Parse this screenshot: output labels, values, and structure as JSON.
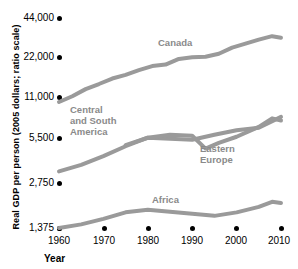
{
  "chart_data": {
    "type": "line",
    "title": "",
    "xlabel": "Year",
    "ylabel": "Real GDP per person (2005 dollars; ratio scale)",
    "scale": "ratio (log) scale",
    "grid": false,
    "legend_position": "inline-labels",
    "xlim": [
      1960,
      2010
    ],
    "ylim": [
      1375,
      44000
    ],
    "xticks": [
      1960,
      1970,
      1980,
      1990,
      2000,
      2010
    ],
    "yticks": [
      1375,
      2750,
      5500,
      11000,
      22000,
      44000
    ],
    "ytick_labels": [
      "1,375",
      "2,750",
      "5,500",
      "11,000",
      "22,000",
      "44,000"
    ],
    "series": [
      {
        "name": "Canada",
        "color": "#9a9a9a",
        "x": [
          1960,
          1963,
          1966,
          1969,
          1972,
          1975,
          1978,
          1981,
          1984,
          1987,
          1990,
          1993,
          1996,
          1999,
          2002,
          2005,
          2008,
          2010
        ],
        "values": [
          11000,
          12100,
          13600,
          14800,
          16200,
          17200,
          18600,
          19900,
          20400,
          22400,
          23000,
          23200,
          24400,
          27000,
          28800,
          30800,
          32600,
          31800
        ]
      },
      {
        "name": "Central and South America",
        "color": "#9a9a9a",
        "x": [
          1960,
          1965,
          1970,
          1975,
          1980,
          1985,
          1990,
          1995,
          2000,
          2005,
          2010
        ],
        "values": [
          3500,
          3900,
          4500,
          5300,
          6100,
          6000,
          5900,
          6400,
          6900,
          7200,
          8600
        ]
      },
      {
        "name": "Eastern Europe",
        "color": "#9a9a9a",
        "x": [
          1975,
          1980,
          1985,
          1990,
          1993,
          1996,
          2000,
          2005,
          2008,
          2010
        ],
        "values": [
          5400,
          6100,
          6400,
          6300,
          5100,
          5600,
          6200,
          7300,
          8400,
          8100
        ]
      },
      {
        "name": "Africa",
        "color": "#9a9a9a",
        "x": [
          1960,
          1965,
          1970,
          1975,
          1980,
          1985,
          1990,
          1995,
          2000,
          2005,
          2008,
          2010
        ],
        "values": [
          1375,
          1460,
          1600,
          1780,
          1860,
          1800,
          1740,
          1680,
          1780,
          1950,
          2120,
          2080
        ]
      }
    ],
    "annotations": [
      {
        "text": "Canada",
        "x": 1983,
        "y": 24000
      },
      {
        "text": "Central and South America",
        "x": 1963,
        "y": 8000
      },
      {
        "text": "Eastern Europe",
        "x": 1993,
        "y": 4300
      },
      {
        "text": "Africa",
        "x": 1986,
        "y": 2500
      }
    ]
  },
  "axes": {
    "ylabel": "Real GDP per person (2005 dollars; ratio scale)",
    "xlabel": "Year",
    "ytick_labels": [
      "44,000",
      "22,000",
      "11,000",
      "5,500",
      "2,750",
      "1,375"
    ],
    "xtick_labels": [
      "1960",
      "1970",
      "1980",
      "1990",
      "2000",
      "2010"
    ]
  },
  "series_labels": {
    "canada": "Canada",
    "central_south_america_line1": "Central",
    "central_south_america_line2": "and South",
    "central_south_america_line3": "America",
    "eastern_europe_line1": "Eastern",
    "eastern_europe_line2": "Europe",
    "africa": "Africa"
  },
  "colors": {
    "line": "#9a9a9a",
    "label": "#8a8a8a",
    "text": "#000000",
    "background": "#ffffff"
  }
}
